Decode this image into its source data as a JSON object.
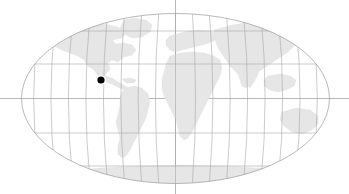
{
  "figure": {
    "name": "world-locator-map",
    "title": "",
    "width": 349,
    "height": 194,
    "background_color": "#ffffff"
  },
  "projection": {
    "type": "robinson",
    "center_x": 175.5,
    "center_y": 98.5,
    "semi_axis_x": 154,
    "semi_axis_y": 85,
    "outline_color": "#9a9a9a",
    "outline_width": 0.7
  },
  "graticule": {
    "color": "#a8a8a8",
    "width": 0.6,
    "meridian_spacing_degrees": 20,
    "parallel_spacing_degrees": 30,
    "meridian_longitudes": [
      -180,
      -160,
      -140,
      -120,
      -100,
      -80,
      -60,
      -40,
      -20,
      0,
      20,
      40,
      60,
      80,
      100,
      120,
      140,
      160,
      180
    ],
    "parallel_latitudes": [
      -60,
      -30,
      0,
      30,
      60
    ],
    "parallel_y_positions": [
      166,
      133,
      98.5,
      64,
      31
    ]
  },
  "crosshair": {
    "equator_y": 98.5,
    "central_meridian_x": 175.5,
    "color": "#9a9a9a",
    "width": 0.7,
    "extends_beyond_globe": true
  },
  "land": {
    "fill_color": "#e6e6e6",
    "stroke_color": "#dcdcdc",
    "regions": [
      "north-america",
      "south-america",
      "greenland",
      "europe",
      "africa",
      "asia",
      "australia",
      "antarctica"
    ]
  },
  "marker": {
    "label": "",
    "x": 101,
    "y": 80,
    "radius": 3.6,
    "color": "#000000",
    "halo_color": "#ffffff",
    "halo_width": 1.2
  }
}
